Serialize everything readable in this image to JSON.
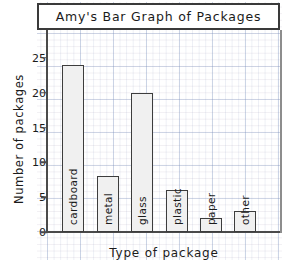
{
  "chart_data": {
    "type": "bar",
    "title": "Amy's Bar Graph of Packages",
    "xlabel": "Type of package",
    "ylabel": "Number of packages",
    "categories": [
      "cardboard",
      "metal",
      "glass",
      "plastic",
      "paper",
      "other"
    ],
    "values": [
      24,
      8,
      20,
      6,
      2,
      3
    ],
    "ylim": [
      0,
      29
    ],
    "yticks": [
      0,
      5,
      10,
      15,
      20,
      25
    ],
    "ytick_labels": [
      "0",
      "5",
      "10",
      "15",
      "20",
      "25"
    ],
    "grid": true,
    "legend": null,
    "style": {
      "bar_fill": "#f0f0f0",
      "bar_outline": "#3d3d3d",
      "axis_color": "#4a4a4a",
      "grid_color": "#7891be",
      "text_color": "#1b1b1b",
      "background": "#ffffff"
    }
  }
}
